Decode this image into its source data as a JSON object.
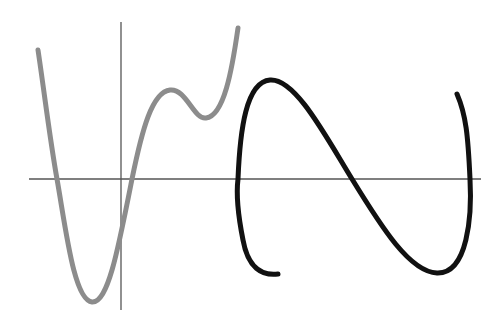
{
  "figure": {
    "background": "#ffffff",
    "axes": {
      "color": "#555555",
      "x_axis": {
        "y": 179,
        "x_start": 29,
        "x_end": 481
      },
      "y_axis": {
        "x": 121,
        "y_start": 22,
        "y_end": 310
      }
    },
    "curves": [
      {
        "name": "function-curve",
        "color": "#8c8c8c",
        "stroke_width": 5,
        "path": "M38,50 C44,90 50,140 57,179 C66,230 74,300 92,302 C108,303 118,250 132,179 C142,130 152,92 170,90 C186,88 194,120 206,118 C224,116 232,70 238,28"
      },
      {
        "name": "relation-curve",
        "color": "#111111",
        "stroke_width": 5,
        "path": "M278,274 C262,276 248,268 243,240 C238,215 236,195 238,179 C240,130 246,82 270,80 C295,78 325,135 352,179 C382,228 410,272 437,273 C468,274 472,215 470,179 C468,135 466,115 457,94"
      }
    ]
  }
}
